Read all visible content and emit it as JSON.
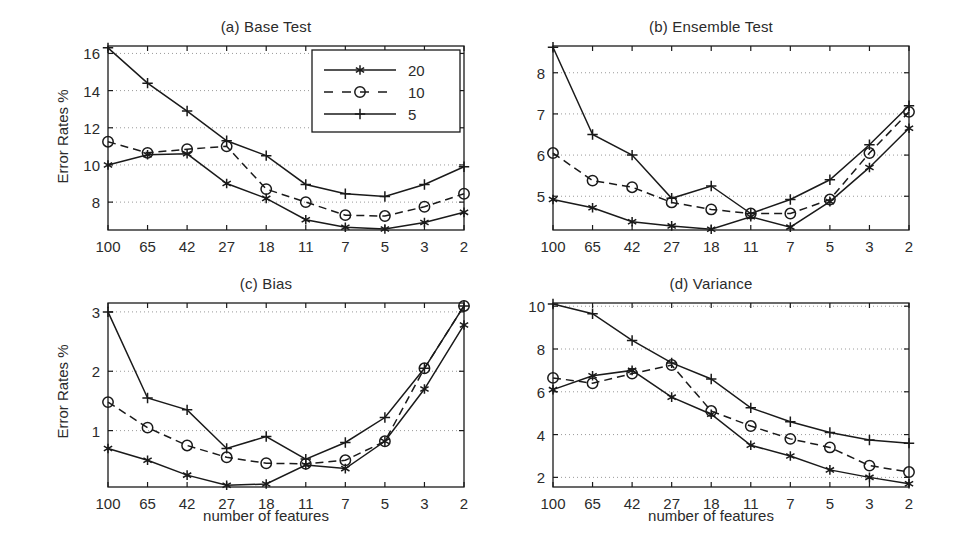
{
  "figure": {
    "background_color": "#ffffff",
    "line_color": "#1a1a1a",
    "grid_color": "#9a9a9a",
    "axis_color": "#1a1a1a",
    "xlabel": "number of features",
    "ylabel": "Error Rates %",
    "legend": {
      "position": "top-right-panel-a",
      "entries": [
        {
          "label": "20",
          "marker": "asterisk",
          "style": "solid"
        },
        {
          "label": "10",
          "marker": "circle",
          "style": "dashed"
        },
        {
          "label": "5",
          "marker": "plus",
          "style": "solid"
        }
      ]
    }
  },
  "chart_data": [
    {
      "type": "line",
      "panel": "a",
      "title": "(a) Base Test",
      "xlabel": "",
      "ylabel": "Error Rates %",
      "categories": [
        "100",
        "65",
        "42",
        "27",
        "18",
        "11",
        "7",
        "5",
        "3",
        "2"
      ],
      "ylim": [
        6.5,
        16.4
      ],
      "yticks": [
        8,
        10,
        12,
        14,
        16
      ],
      "grid": true,
      "series": [
        {
          "name": "20",
          "marker": "asterisk",
          "style": "solid",
          "values": [
            10.0,
            10.55,
            10.6,
            9.0,
            8.2,
            7.05,
            6.65,
            6.55,
            6.9,
            7.45
          ]
        },
        {
          "name": "10",
          "marker": "circle",
          "style": "dashed",
          "values": [
            11.25,
            10.65,
            10.85,
            11.0,
            8.7,
            8.0,
            7.3,
            7.25,
            7.75,
            8.45
          ]
        },
        {
          "name": "5",
          "marker": "plus",
          "style": "solid",
          "values": [
            16.3,
            14.4,
            12.9,
            11.3,
            10.5,
            8.95,
            8.45,
            8.3,
            8.95,
            9.9
          ]
        }
      ]
    },
    {
      "type": "line",
      "panel": "b",
      "title": "(b) Ensemble Test",
      "xlabel": "",
      "ylabel": "",
      "categories": [
        "100",
        "65",
        "42",
        "27",
        "18",
        "11",
        "7",
        "5",
        "3",
        "2"
      ],
      "ylim": [
        4.18,
        8.65
      ],
      "yticks": [
        5,
        6,
        7,
        8
      ],
      "grid": true,
      "series": [
        {
          "name": "20",
          "marker": "asterisk",
          "style": "solid",
          "values": [
            4.92,
            4.72,
            4.38,
            4.28,
            4.2,
            4.5,
            4.25,
            4.87,
            5.7,
            6.65
          ]
        },
        {
          "name": "10",
          "marker": "circle",
          "style": "dashed",
          "values": [
            6.05,
            5.38,
            5.22,
            4.85,
            4.68,
            4.58,
            4.58,
            4.92,
            6.05,
            7.05
          ]
        },
        {
          "name": "5",
          "marker": "plus",
          "style": "solid",
          "values": [
            8.62,
            6.5,
            6.0,
            4.95,
            5.25,
            4.58,
            4.92,
            5.4,
            6.25,
            7.2
          ]
        }
      ]
    },
    {
      "type": "line",
      "panel": "c",
      "title": "(c) Bias",
      "xlabel": "number of features",
      "ylabel": "Error Rates %",
      "categories": [
        "100",
        "65",
        "42",
        "27",
        "18",
        "11",
        "7",
        "5",
        "3",
        "2"
      ],
      "ylim": [
        0.05,
        3.15
      ],
      "yticks": [
        1,
        2,
        3
      ],
      "grid": true,
      "series": [
        {
          "name": "20",
          "marker": "asterisk",
          "style": "solid",
          "values": [
            0.7,
            0.5,
            0.25,
            0.08,
            0.1,
            0.42,
            0.36,
            0.82,
            1.7,
            2.78
          ]
        },
        {
          "name": "10",
          "marker": "circle",
          "style": "dashed",
          "values": [
            1.48,
            1.05,
            0.75,
            0.55,
            0.45,
            0.44,
            0.5,
            0.82,
            2.05,
            3.1
          ]
        },
        {
          "name": "5",
          "marker": "plus",
          "style": "solid",
          "values": [
            3.0,
            1.55,
            1.35,
            0.7,
            0.9,
            0.52,
            0.8,
            1.22,
            2.05,
            3.1
          ]
        }
      ]
    },
    {
      "type": "line",
      "panel": "d",
      "title": "(d) Variance",
      "xlabel": "number of features",
      "ylabel": "",
      "categories": [
        "100",
        "65",
        "42",
        "27",
        "18",
        "11",
        "7",
        "5",
        "3",
        "2"
      ],
      "ylim": [
        1.55,
        10.15
      ],
      "yticks": [
        2,
        4,
        6,
        8,
        10
      ],
      "grid": true,
      "series": [
        {
          "name": "20",
          "marker": "asterisk",
          "style": "solid",
          "values": [
            6.1,
            6.75,
            7.0,
            5.75,
            4.95,
            3.5,
            3.0,
            2.35,
            2.0,
            1.7
          ]
        },
        {
          "name": "10",
          "marker": "circle",
          "style": "dashed",
          "values": [
            6.65,
            6.4,
            6.85,
            7.25,
            5.1,
            4.4,
            3.8,
            3.4,
            2.55,
            2.25
          ]
        },
        {
          "name": "5",
          "marker": "plus",
          "style": "solid",
          "values": [
            10.1,
            9.65,
            8.4,
            7.35,
            6.6,
            5.25,
            4.6,
            4.1,
            3.75,
            3.6
          ]
        }
      ]
    }
  ]
}
